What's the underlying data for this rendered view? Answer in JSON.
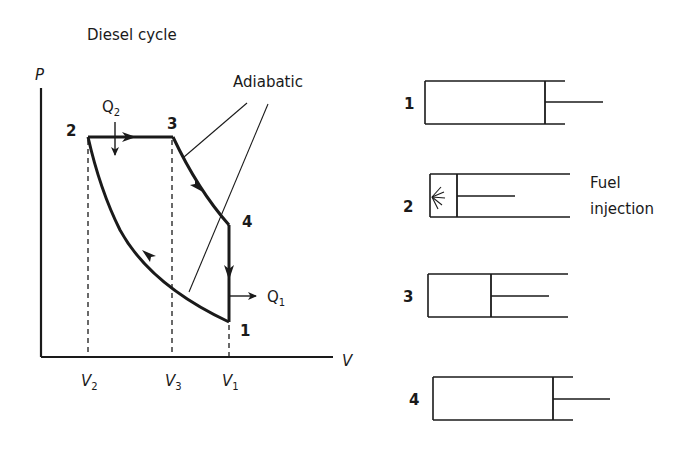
{
  "title": "Diesel cycle",
  "pv_diagram": {
    "axis_y_label": "P",
    "axis_x_label": "V",
    "adiabatic_label": "Adiabatic",
    "points": [
      {
        "id": "1",
        "label": "1"
      },
      {
        "id": "2",
        "label": "2"
      },
      {
        "id": "3",
        "label": "3"
      },
      {
        "id": "4",
        "label": "4"
      }
    ],
    "heat_in": {
      "symbol": "Q",
      "subscript": "2"
    },
    "heat_out": {
      "symbol": "Q",
      "subscript": "1"
    },
    "volume_ticks": [
      {
        "symbol": "V",
        "subscript": "2"
      },
      {
        "symbol": "V",
        "subscript": "3"
      },
      {
        "symbol": "V",
        "subscript": "1"
      }
    ],
    "processes": [
      {
        "from": "2",
        "to": "3",
        "type": "constant pressure (heat addition)"
      },
      {
        "from": "3",
        "to": "4",
        "type": "adiabatic expansion"
      },
      {
        "from": "4",
        "to": "1",
        "type": "constant volume (heat rejection)"
      },
      {
        "from": "1",
        "to": "2",
        "type": "adiabatic compression"
      }
    ]
  },
  "cylinders": [
    {
      "label": "1",
      "piston_position": "bottom dead centre"
    },
    {
      "label": "2",
      "piston_position": "top dead centre",
      "annotation_line1": "Fuel",
      "annotation_line2": "injection"
    },
    {
      "label": "3",
      "piston_position": "mid stroke"
    },
    {
      "label": "4",
      "piston_position": "bottom dead centre"
    }
  ],
  "colors": {
    "ink": "#1a1a1a",
    "background": "#ffffff"
  }
}
